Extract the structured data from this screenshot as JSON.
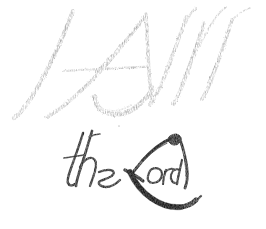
{
  "artwork": {
    "title": "I AM the Lord",
    "medium": "calligraphy-ink-brush",
    "background_color": "#ffffff",
    "canvas": {
      "width": 266,
      "height": 229
    },
    "lines": [
      {
        "id": "line-upper",
        "text": "I AM",
        "style": "italic-capitals-drybrush",
        "ink_color": "#ababab",
        "ink_color_light": "#c7c7c7",
        "ink_color_dark": "#949494",
        "approx_bounds": {
          "x": 12,
          "y": 8,
          "width": 242,
          "height": 118
        }
      },
      {
        "id": "line-lower",
        "text": "the Lord",
        "style": "italic-minuscule-with-swash-capital",
        "ink_color": "#161616",
        "ink_color_soft": "#2e2e2e",
        "approx_bounds": {
          "x": 62,
          "y": 128,
          "width": 136,
          "height": 82
        }
      }
    ],
    "glyphs": [
      {
        "name": "glyph-I",
        "char": "I",
        "line": "line-upper",
        "ink": "#ababab"
      },
      {
        "name": "glyph-A",
        "char": "A",
        "line": "line-upper",
        "ink": "#ababab"
      },
      {
        "name": "glyph-M",
        "char": "M",
        "line": "line-upper",
        "ink": "#ababab"
      },
      {
        "name": "glyph-t",
        "char": "t",
        "line": "line-lower",
        "ink": "#161616"
      },
      {
        "name": "glyph-h",
        "char": "h",
        "line": "line-lower",
        "ink": "#161616"
      },
      {
        "name": "glyph-e",
        "char": "e",
        "line": "line-lower",
        "ink": "#161616"
      },
      {
        "name": "glyph-L",
        "char": "L",
        "line": "line-lower",
        "ink": "#161616"
      },
      {
        "name": "glyph-o",
        "char": "o",
        "line": "line-lower",
        "ink": "#161616"
      },
      {
        "name": "glyph-r",
        "char": "r",
        "line": "line-lower",
        "ink": "#161616"
      },
      {
        "name": "glyph-d",
        "char": "d",
        "line": "line-lower",
        "ink": "#161616"
      }
    ],
    "full_text": "I AM the Lord",
    "ink_palette": {
      "gray_stroke": "#ababab",
      "gray_stroke_light": "#c7c7c7",
      "gray_stroke_dark": "#949494",
      "black_stroke": "#161616",
      "black_stroke_soft": "#2e2e2e",
      "paper": "#ffffff"
    }
  }
}
